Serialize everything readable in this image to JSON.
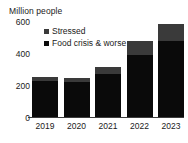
{
  "chart_data": {
    "type": "bar",
    "stacked": true,
    "title": "",
    "subtitle": "",
    "ylabel": "Million people",
    "xlabel": "",
    "categories": [
      "2019",
      "2020",
      "2021",
      "2022",
      "2023"
    ],
    "ylim": [
      0,
      600
    ],
    "yticks": [
      0,
      200,
      400,
      600
    ],
    "ytick_labels": [
      "0",
      "200",
      "400",
      "600"
    ],
    "grid": false,
    "legend_position": "top-left-inside",
    "series": [
      {
        "name": "Food crisis & worse",
        "color": "#0a0a0a",
        "values": [
          205,
          200,
          245,
          355,
          435
        ]
      },
      {
        "name": "Stressed",
        "color": "#3a3a3a",
        "values": [
          25,
          25,
          42,
          82,
          95
        ]
      }
    ],
    "totals": [
      230,
      225,
      287,
      437,
      530
    ],
    "annotations": []
  },
  "axis": {
    "y_title": "Million people",
    "y_tick_0": "0",
    "y_tick_1": "200",
    "y_tick_2": "400",
    "y_tick_3": "600",
    "x_label_0": "2019",
    "x_label_1": "2020",
    "x_label_2": "2021",
    "x_label_3": "2022",
    "x_label_4": "2023"
  },
  "legend": {
    "items": [
      {
        "label": "Stressed",
        "color": "#3a3a3a"
      },
      {
        "label": "Food crisis & worse",
        "color": "#0a0a0a"
      }
    ]
  }
}
